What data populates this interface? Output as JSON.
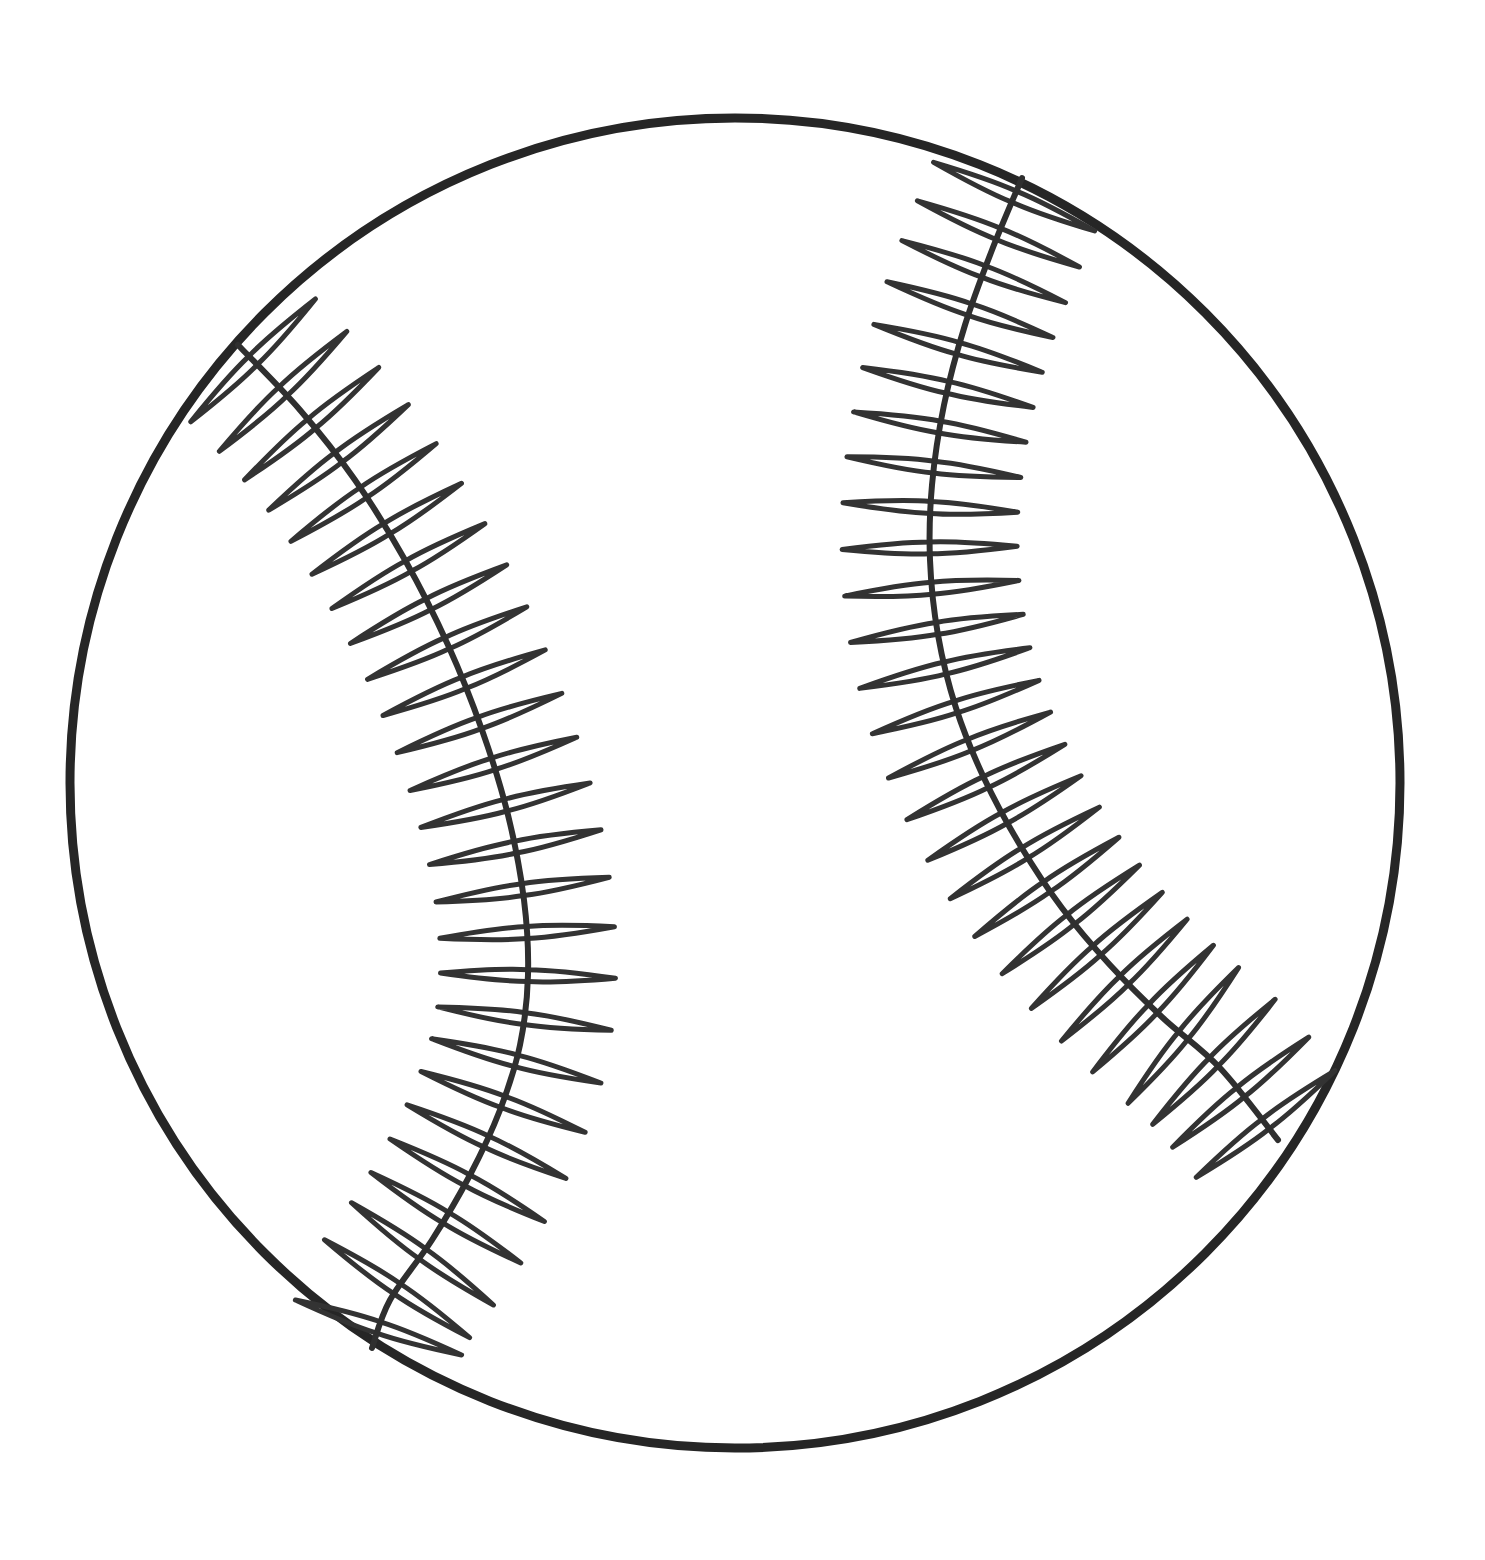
{
  "document": {
    "title": "Baseball Outline Drawing",
    "subject": "baseball",
    "style": "black-and-white line art / coloring page",
    "canvas": {
      "width": 1485,
      "height": 1560,
      "background_color": "#ffffff"
    }
  },
  "colors": {
    "background": "#ffffff",
    "ink": "#2b2b2b",
    "ball_fill": "#ffffff",
    "outline_stroke": "#262626",
    "seam_stroke": "#2f2f2f",
    "stitch_stroke": "#333333"
  },
  "ball": {
    "shape": "circle",
    "center_x": 735,
    "center_y": 783,
    "radius": 665,
    "outline_width": 9,
    "fill": "#ffffff"
  },
  "seams": [
    {
      "id": "left-seam",
      "name": "left-seam",
      "description": "Left seam curve, bulges toward the centre of the ball",
      "stroke_width": 6,
      "stitch_count": 26,
      "stitch_length": 175,
      "stitch_width": 13,
      "path_points": [
        [
          238,
          345
        ],
        [
          300,
          410
        ],
        [
          355,
          480
        ],
        [
          405,
          560
        ],
        [
          448,
          645
        ],
        [
          482,
          730
        ],
        [
          508,
          815
        ],
        [
          524,
          900
        ],
        [
          528,
          975
        ],
        [
          520,
          1045
        ],
        [
          500,
          1110
        ],
        [
          470,
          1175
        ],
        [
          432,
          1240
        ],
        [
          390,
          1300
        ],
        [
          372,
          1348
        ]
      ]
    },
    {
      "id": "right-seam",
      "name": "right-seam",
      "description": "Right seam curve, bulges toward the centre then sweeps down to the lower right edge",
      "stroke_width": 6,
      "stitch_count": 27,
      "stitch_length": 175,
      "stitch_width": 13,
      "path_points": [
        [
          1022,
          178
        ],
        [
          992,
          250
        ],
        [
          965,
          325
        ],
        [
          944,
          405
        ],
        [
          932,
          485
        ],
        [
          930,
          560
        ],
        [
          938,
          635
        ],
        [
          956,
          708
        ],
        [
          984,
          778
        ],
        [
          1020,
          845
        ],
        [
          1062,
          908
        ],
        [
          1110,
          965
        ],
        [
          1163,
          1018
        ],
        [
          1220,
          1068
        ],
        [
          1278,
          1140
        ]
      ]
    }
  ],
  "labels": {
    "artwork_title": "Baseball"
  }
}
